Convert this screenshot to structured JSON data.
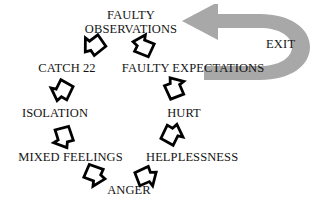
{
  "diagram": {
    "type": "cycle-flow-diagram",
    "background_color": "#ffffff",
    "text_color": "#141414",
    "glyph_color": "#000000",
    "exit_arrow_color": "#a8a8a8"
  },
  "nodes": [
    {
      "id": "faulty-observations",
      "label_line1": "FAULTY",
      "label_line2": "OBSERVATIONS",
      "label": "FAULTY OBSERVATIONS",
      "x": 82,
      "y": 8,
      "width": 98
    },
    {
      "id": "faulty-expectations",
      "label": "FAULTY EXPECTATIONS",
      "x": 119,
      "y": 62,
      "width": 148
    },
    {
      "id": "hurt",
      "label": "HURT",
      "x": 165,
      "y": 107,
      "width": 38
    },
    {
      "id": "helplessness",
      "label": "HELPLESSNESS",
      "x": 146,
      "y": 151,
      "width": 90
    },
    {
      "id": "anger",
      "label": "ANGER",
      "x": 106,
      "y": 184,
      "width": 46
    },
    {
      "id": "mixed-feelings",
      "label": "MIXED FEELINGS",
      "x": 16,
      "y": 151,
      "width": 109
    },
    {
      "id": "isolation",
      "label": "ISOLATION",
      "x": 21,
      "y": 107,
      "width": 68
    },
    {
      "id": "catch-22",
      "label": "CATCH 22",
      "x": 36,
      "y": 62,
      "width": 62
    }
  ],
  "flow_glyphs": [
    {
      "id": "glyph-catch22-to-faulty-observations",
      "name": "arrow-glyph",
      "x": 80,
      "y": 32,
      "rotation": -42
    },
    {
      "id": "glyph-faulty-observations-to-faulty-expectations",
      "name": "arrow-glyph",
      "x": 130,
      "y": 32,
      "rotation": 18
    },
    {
      "id": "glyph-faulty-expectations-to-hurt",
      "name": "arrow-glyph",
      "x": 162,
      "y": 74,
      "rotation": 62
    },
    {
      "id": "glyph-hurt-to-helplessness",
      "name": "arrow-glyph",
      "x": 160,
      "y": 121,
      "rotation": 112
    },
    {
      "id": "glyph-helplessness-to-anger",
      "name": "arrow-glyph",
      "x": 134,
      "y": 164,
      "rotation": 152
    },
    {
      "id": "glyph-anger-to-mixed-feelings",
      "name": "arrow-glyph",
      "x": 82,
      "y": 163,
      "rotation": 196
    },
    {
      "id": "glyph-mixed-feelings-to-isolation",
      "name": "arrow-glyph",
      "x": 50,
      "y": 125,
      "rotation": 248
    },
    {
      "id": "glyph-isolation-to-catch22",
      "name": "arrow-glyph",
      "x": 48,
      "y": 78,
      "rotation": 292
    }
  ],
  "exit": {
    "label": "EXIT",
    "arrow_name": "exit-u-turn-arrow",
    "color": "#a8a8a8",
    "x": 266,
    "y": 37
  }
}
